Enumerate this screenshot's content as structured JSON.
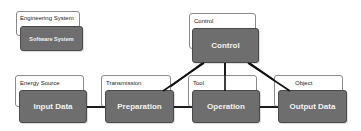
{
  "legend": {
    "outer_label": "Engineering System",
    "inner_label": "Software System"
  },
  "nodes": {
    "control": {
      "label": "Control",
      "category": "Control"
    },
    "input": {
      "label": "Input Data",
      "category": "Energy Source"
    },
    "preparation": {
      "label": "Preparation",
      "category": "Transmission"
    },
    "operation": {
      "label": "Operation",
      "category": "Tool"
    },
    "output": {
      "label": "Output Data",
      "category": "Object"
    }
  },
  "colors": {
    "node_fill": "#6e6e6e",
    "node_text": "#f2f2f2",
    "line": "#111111"
  }
}
